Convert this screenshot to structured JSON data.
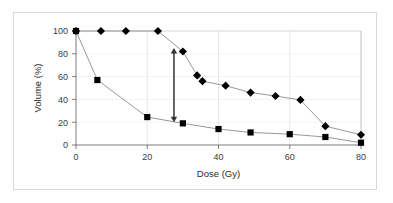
{
  "chart_data": {
    "type": "line",
    "title": "",
    "xlabel": "Dose (Gy)",
    "ylabel": "Volume (%)",
    "xlim": [
      0,
      80
    ],
    "ylim": [
      0,
      100
    ],
    "xticks": [
      0,
      20,
      40,
      60,
      80
    ],
    "yticks": [
      0,
      20,
      40,
      60,
      80,
      100
    ],
    "xtick_labels": [
      "0",
      "20",
      "40",
      "60",
      "80"
    ],
    "ytick_labels": [
      "0",
      "20",
      "40",
      "60",
      "80",
      "100"
    ],
    "grid": "horizontal-and-vertical-light",
    "legend": "none",
    "series": [
      {
        "name": "diamond-series",
        "marker": "diamond",
        "color": "#000000",
        "line_color": "#808080",
        "x": [
          0,
          7,
          14,
          23,
          30,
          34,
          35.5,
          42,
          49,
          56,
          63,
          70,
          80
        ],
        "y": [
          100,
          100,
          100,
          100,
          82,
          61,
          56,
          52,
          46,
          43,
          39.5,
          16.5,
          9
        ],
        "points": [
          {
            "x": 0,
            "y": 100
          },
          {
            "x": 7,
            "y": 100
          },
          {
            "x": 14,
            "y": 100
          },
          {
            "x": 23,
            "y": 100
          },
          {
            "x": 30,
            "y": 82
          },
          {
            "x": 34,
            "y": 61
          },
          {
            "x": 35.5,
            "y": 56
          },
          {
            "x": 42,
            "y": 52
          },
          {
            "x": 49,
            "y": 46
          },
          {
            "x": 56,
            "y": 43
          },
          {
            "x": 63,
            "y": 39.5
          },
          {
            "x": 70,
            "y": 16.5
          },
          {
            "x": 80,
            "y": 9
          }
        ]
      },
      {
        "name": "square-series",
        "marker": "square",
        "color": "#000000",
        "line_color": "#808080",
        "x": [
          0,
          6,
          20,
          30,
          40,
          49,
          60,
          70,
          80
        ],
        "y": [
          100,
          57,
          24.5,
          19,
          14,
          11,
          9.5,
          7,
          2
        ],
        "points": [
          {
            "x": 0,
            "y": 100
          },
          {
            "x": 6,
            "y": 57
          },
          {
            "x": 20,
            "y": 24.5
          },
          {
            "x": 30,
            "y": 19
          },
          {
            "x": 40,
            "y": 14
          },
          {
            "x": 49,
            "y": 11
          },
          {
            "x": 60,
            "y": 9.5
          },
          {
            "x": 70,
            "y": 7
          },
          {
            "x": 80,
            "y": 2
          }
        ]
      }
    ],
    "annotations": [
      {
        "name": "vertical-double-arrow",
        "type": "double-headed-arrow",
        "x": 27.5,
        "y_top": 85,
        "y_bottom": 20,
        "color": "#333333",
        "label": ""
      }
    ]
  }
}
